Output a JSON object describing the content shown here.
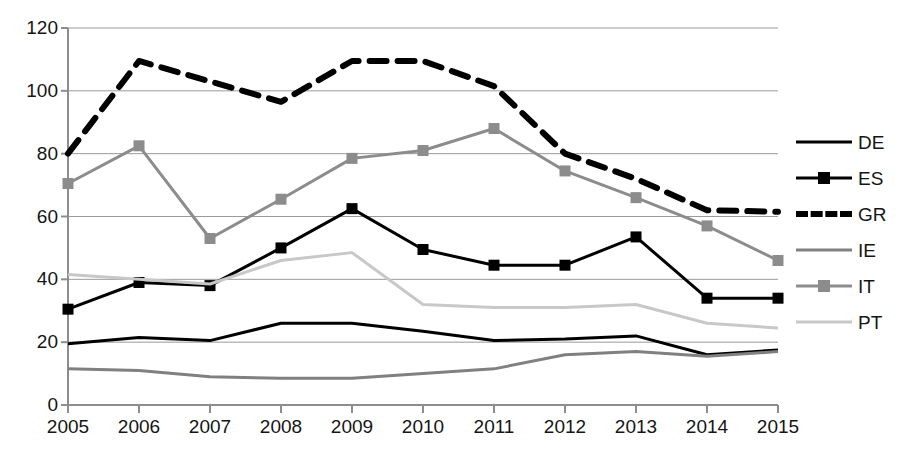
{
  "chart_data": {
    "type": "line",
    "title": "",
    "xlabel": "",
    "ylabel": "",
    "x": [
      2005,
      2006,
      2007,
      2008,
      2009,
      2010,
      2011,
      2012,
      2013,
      2014,
      2015
    ],
    "categories": [
      "2005",
      "2006",
      "2007",
      "2008",
      "2009",
      "2010",
      "2011",
      "2012",
      "2013",
      "2014",
      "2015"
    ],
    "ylim": [
      0,
      120
    ],
    "yticks": [
      0,
      20,
      40,
      60,
      80,
      100,
      120
    ],
    "ytick_labels": [
      "0",
      "20",
      "40",
      "60",
      "80",
      "100",
      "120"
    ],
    "grid": "horizontal",
    "legend_position": "right",
    "series": [
      {
        "name": "DE",
        "color": "#000000",
        "style": "solid",
        "width": 3,
        "marker": "none",
        "values": [
          19.5,
          21.5,
          20.5,
          26,
          26,
          23.5,
          20.5,
          21,
          22,
          16,
          17.5
        ]
      },
      {
        "name": "ES",
        "color": "#000000",
        "style": "solid",
        "width": 3,
        "marker": "square",
        "values": [
          30.5,
          39,
          38,
          50,
          62.5,
          49.5,
          44.5,
          44.5,
          53.5,
          34,
          34
        ]
      },
      {
        "name": "GR",
        "color": "#000000",
        "style": "dashed",
        "width": 6,
        "marker": "none",
        "values": [
          80,
          109.5,
          103,
          96.5,
          109.5,
          109.5,
          101.5,
          80,
          72,
          62,
          61.5
        ]
      },
      {
        "name": "IE",
        "color": "#808080",
        "style": "solid",
        "width": 3,
        "marker": "none",
        "values": [
          11.5,
          11,
          9,
          8.5,
          8.5,
          10,
          11.5,
          16,
          17,
          15.5,
          17
        ]
      },
      {
        "name": "IT",
        "color": "#8c8c8c",
        "style": "solid",
        "width": 3,
        "marker": "square",
        "values": [
          70.5,
          82.5,
          53,
          65.5,
          78.5,
          81,
          88,
          74.5,
          66,
          57,
          46
        ]
      },
      {
        "name": "PT",
        "color": "#c8c8c8",
        "style": "solid",
        "width": 3,
        "marker": "none",
        "values": [
          41.5,
          40,
          38.5,
          46,
          48.5,
          32,
          31,
          31,
          32,
          26,
          24.5
        ]
      }
    ]
  },
  "legend": {
    "items": [
      {
        "label": "DE"
      },
      {
        "label": "ES"
      },
      {
        "label": "GR"
      },
      {
        "label": "IE"
      },
      {
        "label": "IT"
      },
      {
        "label": "PT"
      }
    ]
  }
}
